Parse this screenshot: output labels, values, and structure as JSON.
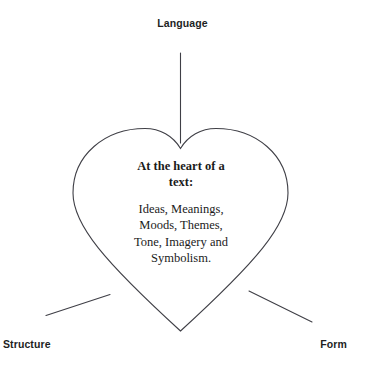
{
  "diagram": {
    "type": "concept-map",
    "title_node": {
      "heading": "At the heart of a text:",
      "heading_line_1": "At the heart of a",
      "heading_line_2": "text:",
      "body_lines": [
        "Ideas, Meanings,",
        "Moods, Themes,",
        "Tone, Imagery and",
        "Symbolism."
      ]
    },
    "nodes": [
      {
        "id": "language",
        "label": "Language",
        "position": "top-center"
      },
      {
        "id": "structure",
        "label": "Structure",
        "position": "bottom-left"
      },
      {
        "id": "form",
        "label": "Form",
        "position": "bottom-right"
      }
    ],
    "connectors": [
      {
        "from": "language",
        "to": "heart",
        "kind": "vertical-line"
      },
      {
        "from": "structure",
        "to": "heart",
        "kind": "diagonal-line"
      },
      {
        "from": "form",
        "to": "heart",
        "kind": "diagonal-line"
      }
    ],
    "colors": {
      "background": "#ffffff",
      "stroke": "#3f3f46",
      "label_text": "#221f1f",
      "heart_text": "#1b1b1b"
    }
  }
}
